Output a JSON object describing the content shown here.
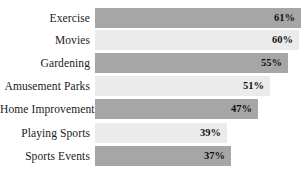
{
  "chart_data": {
    "type": "bar",
    "orientation": "horizontal",
    "title": "",
    "subtitle": "",
    "xlabel": "",
    "ylabel": "",
    "categories": [
      "Exercise",
      "Movies",
      "Gardening",
      "Amusement Parks",
      "Home Improvement",
      "Playing Sports",
      "Sports Events"
    ],
    "values": [
      61,
      60,
      55,
      51,
      47,
      39,
      37
    ],
    "value_labels": [
      "61%",
      "60%",
      "55%",
      "51%",
      "47%",
      "39%",
      "37%"
    ],
    "xlim": [
      0,
      61
    ],
    "grid": false,
    "legend": false,
    "axis_visible": false,
    "tick_labels": [],
    "bar_colors": [
      "#a6a6a6",
      "#ebebeb",
      "#a6a6a6",
      "#ebebeb",
      "#a6a6a6",
      "#ebebeb",
      "#a6a6a6"
    ]
  },
  "bars": [
    {
      "label": "Exercise",
      "value_label": "61%",
      "shade": "dark",
      "top": 8,
      "start": 95,
      "end": 301
    },
    {
      "label": "Movies",
      "value_label": "60%",
      "shade": "light",
      "top": 30,
      "start": 95,
      "end": 299
    },
    {
      "label": "Gardening",
      "value_label": "55%",
      "shade": "dark",
      "top": 53,
      "start": 95,
      "end": 288
    },
    {
      "label": "Amusement Parks",
      "value_label": "51%",
      "shade": "light",
      "top": 76,
      "start": 95,
      "end": 270
    },
    {
      "label": "Home Improvement",
      "value_label": "47%",
      "shade": "dark",
      "top": 99,
      "start": 95,
      "end": 258
    },
    {
      "label": "Playing Sports",
      "value_label": "39%",
      "shade": "light",
      "top": 123,
      "start": 95,
      "end": 227
    },
    {
      "label": "Sports Events",
      "value_label": "37%",
      "shade": "dark",
      "top": 146,
      "start": 95,
      "end": 231
    }
  ]
}
